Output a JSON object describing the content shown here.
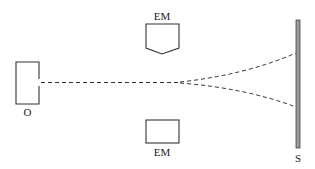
{
  "diagram": {
    "labels": {
      "source": "O",
      "electromagnet_top": "EM",
      "electromagnet_bottom": "EM",
      "screen": "S"
    },
    "components": [
      {
        "id": "source",
        "label": "O",
        "description": "Electron source / oven"
      },
      {
        "id": "electromagnet_top",
        "label": "EM",
        "description": "Electromagnet with pointed pole piece"
      },
      {
        "id": "electromagnet_bottom",
        "label": "EM",
        "description": "Electromagnet with flat pole piece"
      },
      {
        "id": "screen",
        "label": "S",
        "description": "Detection screen"
      }
    ],
    "beam": {
      "style": "dashed",
      "splits_into": 2,
      "description": "Beam travels from O toward S and splits into two dashed paths between the electromagnets"
    },
    "colors": {
      "line": "#333333",
      "screen_fill": "#9a9a9a",
      "background": "#ffffff"
    }
  }
}
